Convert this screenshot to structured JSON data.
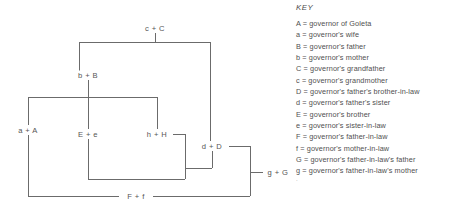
{
  "diagram": {
    "type": "kinship-lattice-diagram",
    "nodes": [
      {
        "id": "cC",
        "label": "c + C",
        "x": 155,
        "y": 28
      },
      {
        "id": "bB",
        "label": "b + B",
        "x": 88,
        "y": 75
      },
      {
        "id": "aA",
        "label": "a + A",
        "x": 28,
        "y": 130
      },
      {
        "id": "Ee",
        "label": "E + e",
        "x": 88,
        "y": 134
      },
      {
        "id": "hH",
        "label": "h + H",
        "x": 157,
        "y": 134
      },
      {
        "id": "dD",
        "label": "d + D",
        "x": 212,
        "y": 146
      },
      {
        "id": "gG",
        "label": "g + G",
        "x": 278,
        "y": 172
      },
      {
        "id": "Ff",
        "label": "F + f",
        "x": 136,
        "y": 196
      }
    ],
    "edges": [
      {
        "from": "cC",
        "to": "bB"
      },
      {
        "from": "cC",
        "to": "dD"
      },
      {
        "from": "bB",
        "to": "aA"
      },
      {
        "from": "bB",
        "to": "Ee"
      },
      {
        "from": "bB",
        "to": "hH"
      },
      {
        "from": "hH",
        "to": "dD"
      },
      {
        "from": "Ee",
        "to": "dD"
      },
      {
        "from": "dD",
        "to": "gG"
      },
      {
        "from": "dD",
        "to": "Ff"
      },
      {
        "from": "aA",
        "to": "Ff"
      }
    ]
  },
  "key": {
    "title": "KEY",
    "entries": [
      "A = governor of Goleta",
      "a = governor's wife",
      "B = governor's father",
      "b = governor's mother",
      "C = governor's grandfather",
      "c = governor's grandmother",
      "D = governor's father's brother-in-law",
      "d = governor's father's sister",
      "E = governor's brother",
      "e = governor's sister-in-law",
      "F = governor's father-in-law",
      "f = governor's mother-in-law",
      "G = governor's father-in-law's father",
      "g = governor's father-in-law's mother"
    ],
    "clipped_entry": "h ="
  },
  "colors": {
    "line": "#6b6b6b",
    "text": "#505050",
    "background": "#ffffff"
  }
}
